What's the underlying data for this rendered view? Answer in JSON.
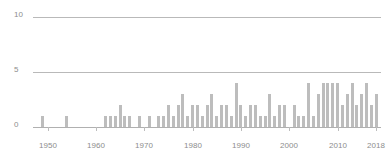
{
  "chart_data": {
    "type": "bar",
    "title": "",
    "subtitle": "",
    "xlabel": "",
    "ylabel": "",
    "xlim": [
      1947,
      2019
    ],
    "ylim": [
      0,
      10
    ],
    "grid": true,
    "gridlines_y": [
      0,
      5,
      10
    ],
    "legend": null,
    "y_tick_labels": [
      "0",
      "5",
      "10"
    ],
    "y_ticks": [
      0,
      5,
      10
    ],
    "x_tick_labels": [
      "1950",
      "1960",
      "1970",
      "1980",
      "1990",
      "2000",
      "2010",
      "2018"
    ],
    "x_ticks": [
      1950,
      1960,
      1970,
      1980,
      1990,
      2000,
      2010,
      2018
    ],
    "bar_color": "#bdbdbd",
    "axis_color": "#b9b9b9",
    "label_color": "#8d8d8d",
    "categories": [
      1949,
      1950,
      1951,
      1952,
      1953,
      1954,
      1955,
      1956,
      1957,
      1958,
      1959,
      1960,
      1961,
      1962,
      1963,
      1964,
      1965,
      1966,
      1967,
      1968,
      1969,
      1970,
      1971,
      1972,
      1973,
      1974,
      1975,
      1976,
      1977,
      1978,
      1979,
      1980,
      1981,
      1982,
      1983,
      1984,
      1985,
      1986,
      1987,
      1988,
      1989,
      1990,
      1991,
      1992,
      1993,
      1994,
      1995,
      1996,
      1997,
      1998,
      1999,
      2000,
      2001,
      2002,
      2003,
      2004,
      2005,
      2006,
      2007,
      2008,
      2009,
      2010,
      2011,
      2012,
      2013,
      2014,
      2015,
      2016,
      2017,
      2018
    ],
    "values": [
      1,
      0,
      0,
      0,
      0,
      1,
      0,
      0,
      0,
      0,
      0,
      0,
      0,
      1,
      1,
      1,
      2,
      1,
      1,
      0,
      1,
      0,
      1,
      0,
      1,
      1,
      2,
      1,
      2,
      3,
      1,
      2,
      2,
      1,
      2,
      3,
      1,
      2,
      2,
      1,
      4,
      2,
      1,
      2,
      2,
      1,
      1,
      3,
      1,
      2,
      2,
      0,
      2,
      1,
      1,
      4,
      1,
      3,
      4,
      4,
      4,
      4,
      2,
      3,
      4,
      2,
      3,
      4,
      2,
      3
    ]
  }
}
